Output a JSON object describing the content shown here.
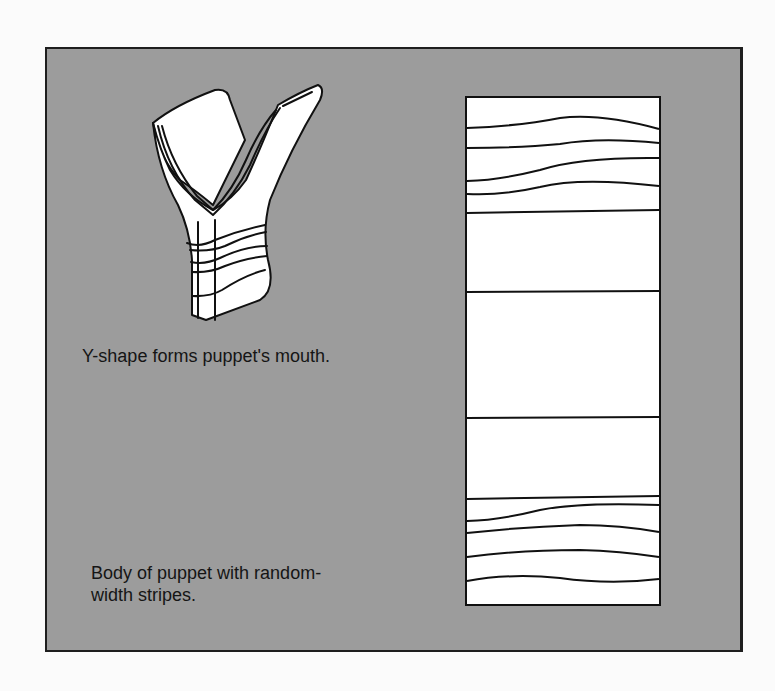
{
  "figure": {
    "background_color": "#9c9c9c",
    "outline_color": "#1e1e1e",
    "mouth_illustration": {
      "caption": "Y-shape forms puppet's mouth."
    },
    "body_illustration": {
      "caption_line1": "Body of puppet with random-",
      "caption_line2": "width stripes."
    }
  }
}
